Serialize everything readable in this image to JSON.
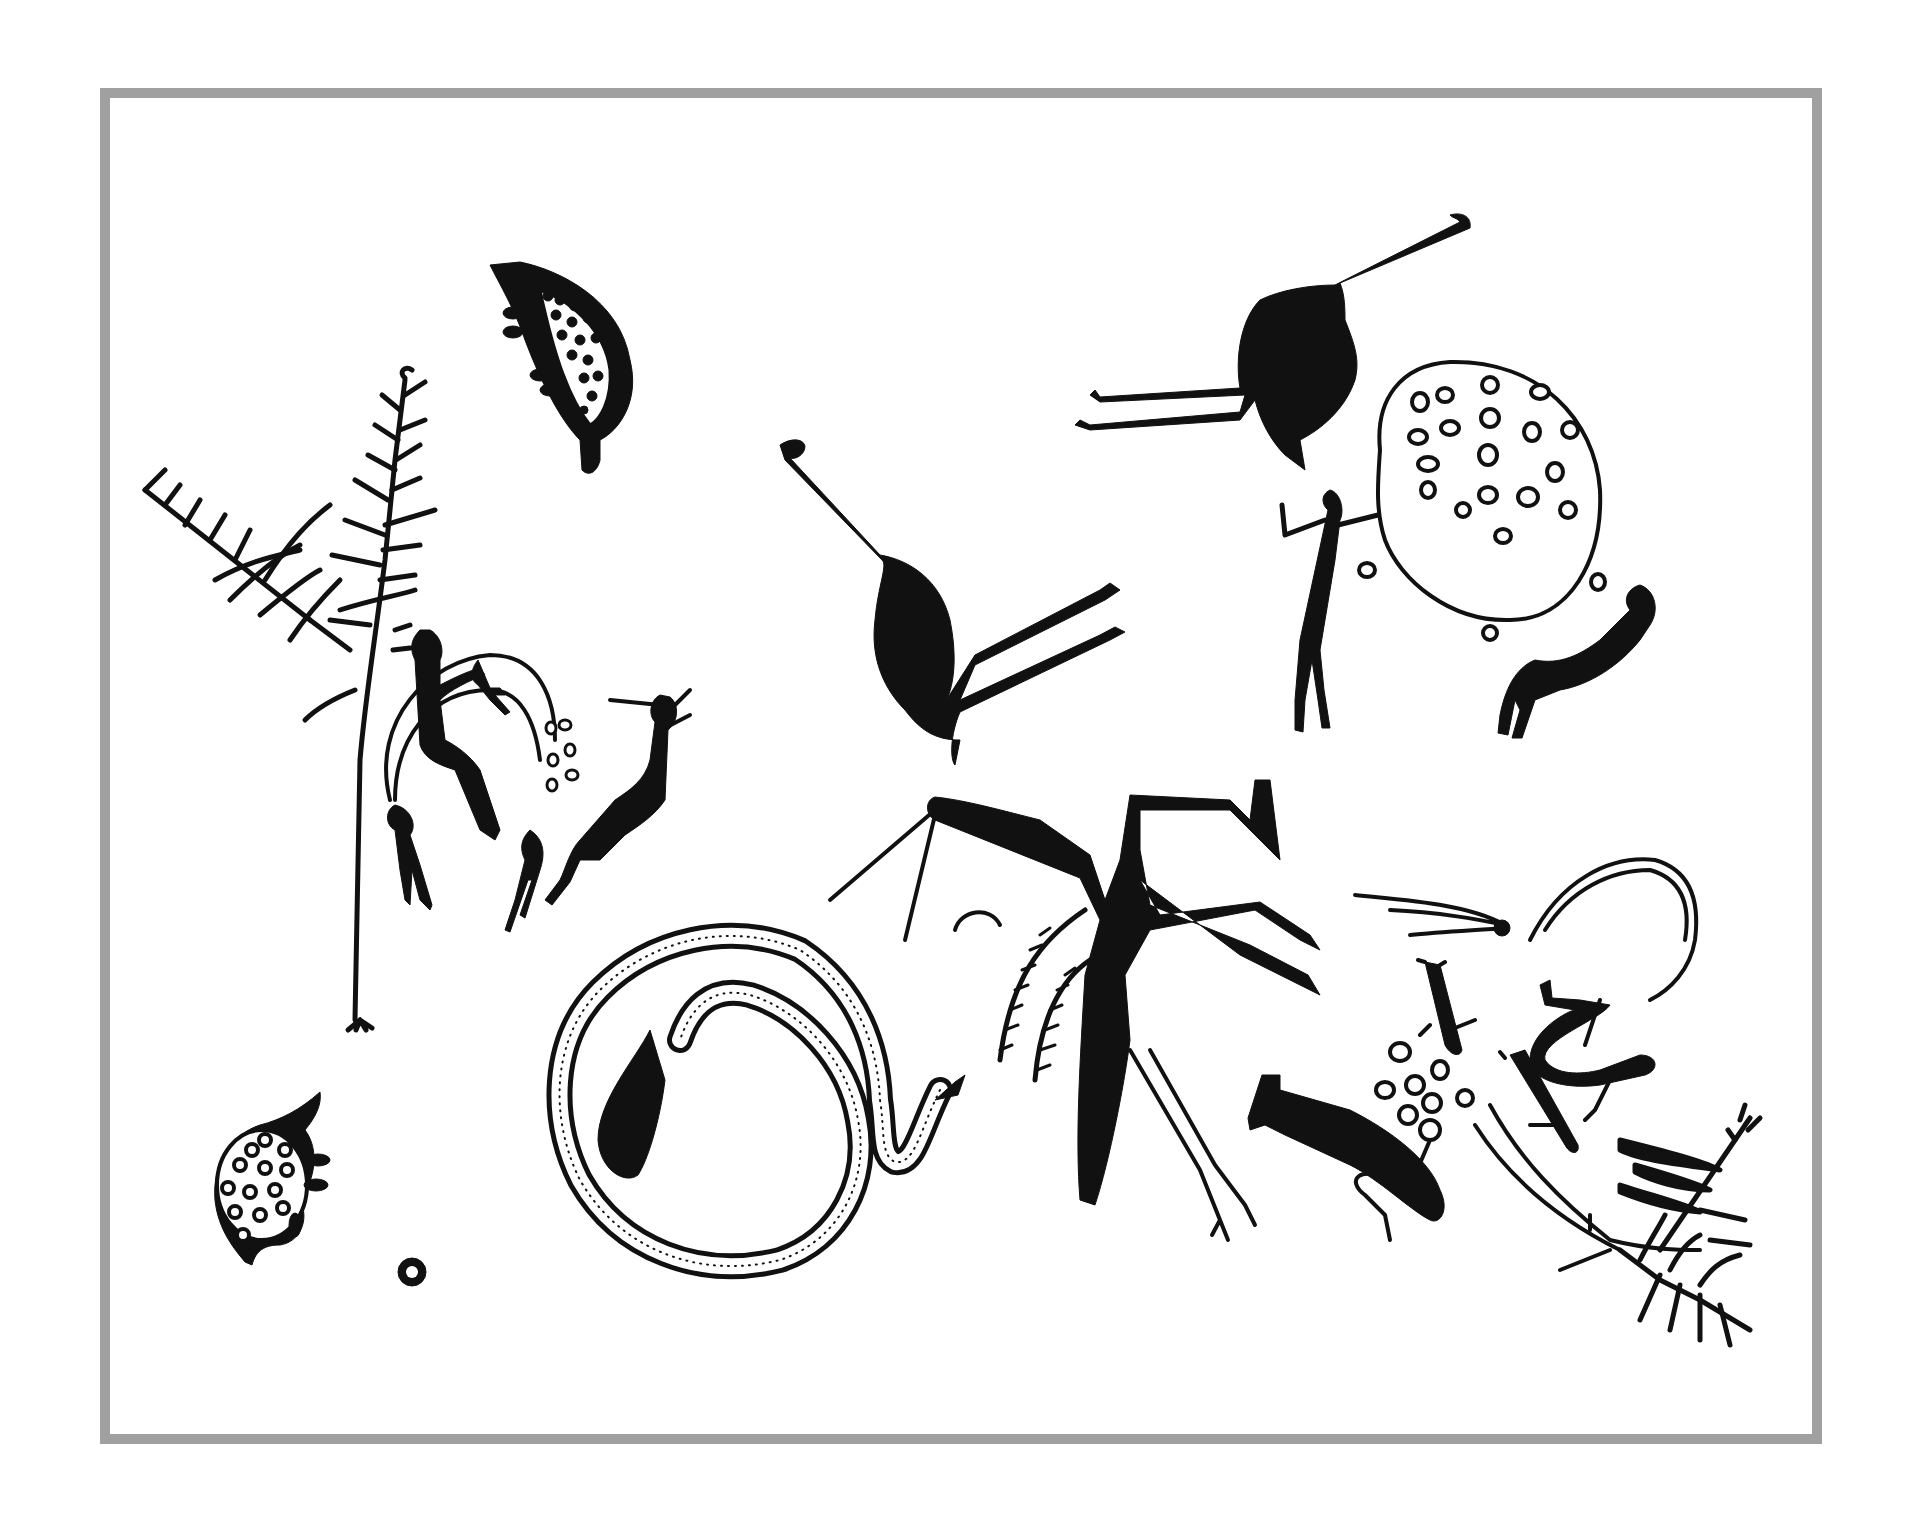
{
  "artwork": {
    "style": "rock-art line drawing",
    "frame_color": "#a0a0a0",
    "ink_color": "#111111",
    "background": "#ffffff",
    "motifs": [
      "turtle-top",
      "turtle-bottom",
      "tree-left",
      "seated-figures-in-shelter",
      "emu-center",
      "emu-top-right",
      "dotted-circle",
      "standing-figure",
      "leaning-figure",
      "central-tall-figure",
      "coiled-snake",
      "lower-right-figures",
      "fern-branch-right",
      "small-circle"
    ]
  }
}
